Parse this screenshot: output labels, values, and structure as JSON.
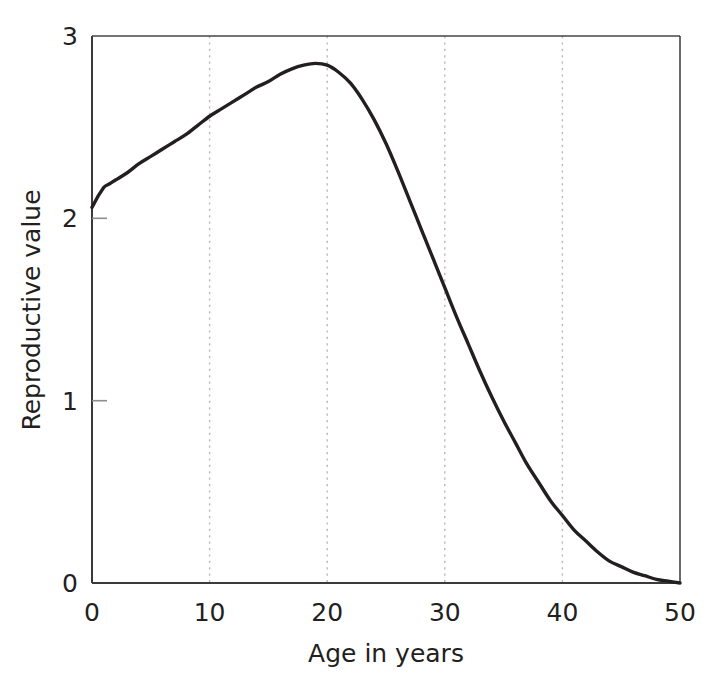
{
  "chart_data": {
    "type": "line",
    "title": "",
    "xlabel": "Age in years",
    "ylabel": "Reproductive value",
    "xlim": [
      0,
      50
    ],
    "ylim": [
      0,
      3
    ],
    "xticks": [
      0,
      10,
      20,
      30,
      40,
      50
    ],
    "xtick_labels": [
      "0",
      "10",
      "20",
      "30",
      "40",
      "50"
    ],
    "yticks": [
      0,
      1,
      2,
      3
    ],
    "ytick_labels": [
      "0",
      "1",
      "2",
      "3"
    ],
    "grid": "vertical dotted gridlines at x = 10, 20, 30, 40",
    "legend": "none",
    "series": [
      {
        "name": "Reproductive value",
        "color": "#231f20",
        "x": [
          0,
          0.5,
          1,
          1.5,
          2,
          3,
          4,
          5,
          6,
          7,
          8,
          9,
          10,
          11,
          12,
          13,
          14,
          15,
          16,
          17,
          18,
          19,
          20,
          21,
          22,
          23,
          24,
          25,
          26,
          27,
          28,
          29,
          30,
          31,
          32,
          33,
          34,
          35,
          36,
          37,
          38,
          39,
          40,
          41,
          42,
          43,
          44,
          45,
          46,
          47,
          48,
          49,
          50
        ],
        "y": [
          2.06,
          2.12,
          2.17,
          2.19,
          2.21,
          2.25,
          2.3,
          2.34,
          2.38,
          2.42,
          2.46,
          2.51,
          2.56,
          2.6,
          2.64,
          2.68,
          2.72,
          2.75,
          2.79,
          2.82,
          2.84,
          2.85,
          2.84,
          2.8,
          2.74,
          2.65,
          2.54,
          2.41,
          2.26,
          2.1,
          1.94,
          1.78,
          1.62,
          1.46,
          1.31,
          1.16,
          1.02,
          0.89,
          0.77,
          0.65,
          0.55,
          0.45,
          0.37,
          0.29,
          0.23,
          0.17,
          0.12,
          0.09,
          0.06,
          0.04,
          0.02,
          0.01,
          0.0
        ]
      }
    ],
    "annotations": {
      "peak_age": 19,
      "peak_value": 2.85,
      "start_value": 2.06,
      "end_value": 0.0
    },
    "colors": {
      "line": "#231f20",
      "axis": "#231f20",
      "gridline": "#b9b9b9",
      "background": "#ffffff"
    }
  }
}
